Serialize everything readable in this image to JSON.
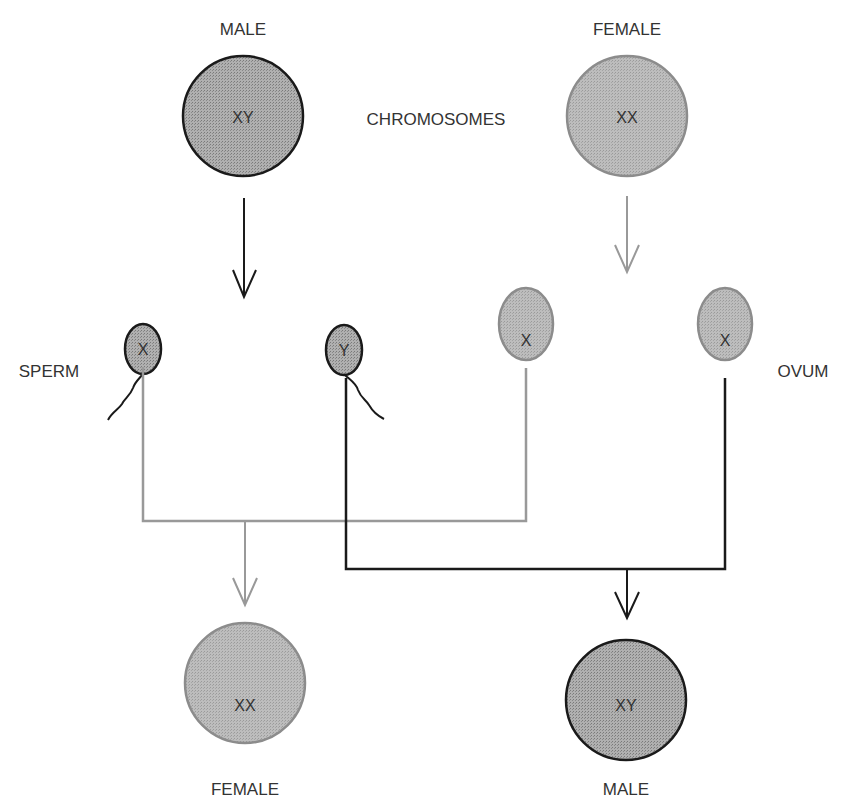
{
  "title_label": "CHROMOSOMES",
  "parents": {
    "male": {
      "label": "MALE",
      "chromosomes": "XY"
    },
    "female": {
      "label": "FEMALE",
      "chromosomes": "XX"
    }
  },
  "gametes": {
    "sperm_label": "SPERM",
    "ovum_label": "OVUM",
    "sperm": [
      {
        "chromosome": "X"
      },
      {
        "chromosome": "Y"
      }
    ],
    "ova": [
      {
        "chromosome": "X"
      },
      {
        "chromosome": "X"
      }
    ]
  },
  "offspring": {
    "female": {
      "label": "FEMALE",
      "chromosomes": "XX"
    },
    "male": {
      "label": "MALE",
      "chromosomes": "XY"
    }
  },
  "colors": {
    "male_fill": "#a9a9a9",
    "male_stroke": "#1a1a1a",
    "female_fill": "#b3b3b3",
    "female_stroke": "#8c8c8c",
    "female_line": "#999999",
    "male_line": "#1a1a1a"
  }
}
